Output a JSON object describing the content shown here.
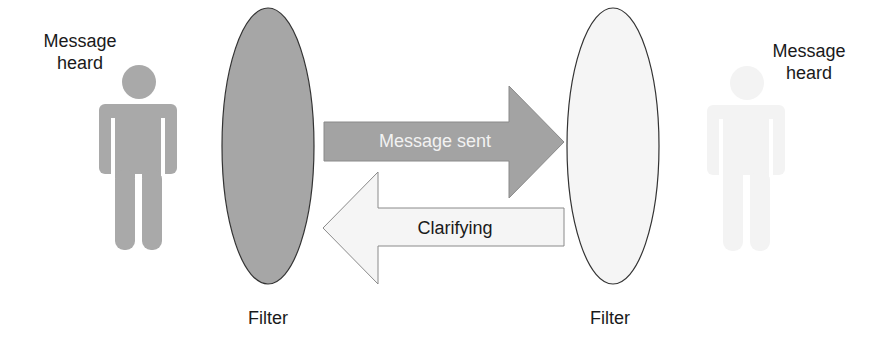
{
  "diagram": {
    "left_person": {
      "label_line1": "Message",
      "label_line2": "heard",
      "color": "#a9a9a9"
    },
    "right_person": {
      "label_line1": "Message",
      "label_line2": "heard",
      "color": "#f4f4f4"
    },
    "left_filter": {
      "label": "Filter",
      "fill": "#a6a6a6"
    },
    "right_filter": {
      "label": "Filter",
      "fill": "#f5f5f5"
    },
    "arrow_sent": {
      "label": "Message sent",
      "fill": "#a3a3a3",
      "text_color": "#f2f2f2"
    },
    "arrow_clarify": {
      "label": "Clarifying",
      "fill": "#f5f5f5",
      "text_color": "#1a1a1a"
    }
  }
}
